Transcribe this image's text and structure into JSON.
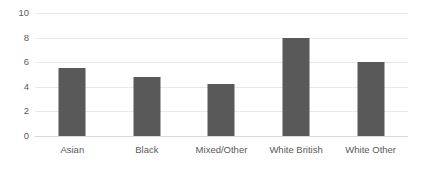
{
  "chart_data": {
    "type": "bar",
    "title": "",
    "subtitle": "",
    "xlabel": "",
    "ylabel": "",
    "categories": [
      "Asian",
      "Black",
      "Mixed/Other",
      "White British",
      "White Other"
    ],
    "values": [
      5.5,
      4.8,
      4.2,
      8.0,
      6.0
    ],
    "series": [
      {
        "name": "",
        "values": [
          5.5,
          4.8,
          4.2,
          8.0,
          6.0
        ]
      }
    ],
    "ylim": [
      0,
      10
    ],
    "yticks": [
      0,
      2,
      4,
      6,
      8,
      10
    ],
    "ytick_labels": [
      "0",
      "2",
      "4",
      "6",
      "8",
      "10"
    ],
    "xtick_labels": [
      "Asian",
      "Black",
      "Mixed/Other",
      "White British",
      "White Other"
    ],
    "grid": "horizontal",
    "legend": "none",
    "annotations": [],
    "colors": {
      "bar": "#595959",
      "gridline": "#e8e8e8",
      "baseline": "#d9d9d9",
      "text": "#595959",
      "background": "#ffffff"
    }
  }
}
